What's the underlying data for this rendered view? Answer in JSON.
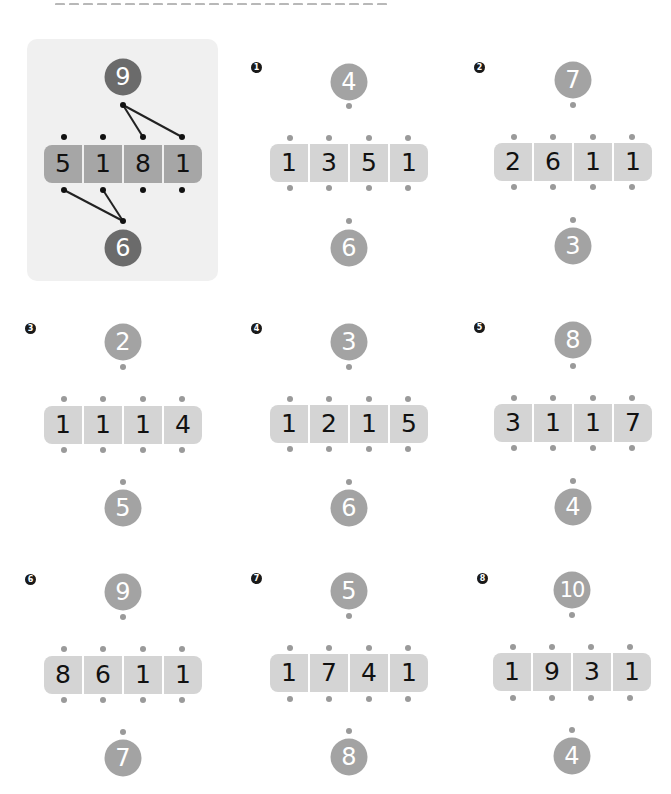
{
  "page": {
    "heading_clipped": true
  },
  "colors": {
    "example_panel_bg": "#f0f0f0",
    "example_circle": "#6b6b6b",
    "example_strip": "#a6a6a6",
    "circle": "#a3a3a3",
    "strip": "#d4d4d4",
    "dot": "#9a9a9a",
    "line": "#222222"
  },
  "example": {
    "top": "9",
    "digits": [
      "5",
      "1",
      "8",
      "1"
    ],
    "bottom": "6",
    "top_connects_to_cells": [
      2,
      3
    ],
    "bottom_connects_to_cells": [
      0,
      1
    ]
  },
  "problems": [
    {
      "number": "1",
      "badge": "❶",
      "top": "4",
      "digits": [
        "1",
        "3",
        "5",
        "1"
      ],
      "bottom": "6"
    },
    {
      "number": "2",
      "badge": "❷",
      "top": "7",
      "digits": [
        "2",
        "6",
        "1",
        "1"
      ],
      "bottom": "3"
    },
    {
      "number": "3",
      "badge": "❸",
      "top": "2",
      "digits": [
        "1",
        "1",
        "1",
        "4"
      ],
      "bottom": "5"
    },
    {
      "number": "4",
      "badge": "❹",
      "top": "3",
      "digits": [
        "1",
        "2",
        "1",
        "5"
      ],
      "bottom": "6"
    },
    {
      "number": "5",
      "badge": "❺",
      "top": "8",
      "digits": [
        "3",
        "1",
        "1",
        "7"
      ],
      "bottom": "4"
    },
    {
      "number": "6",
      "badge": "❻",
      "top": "9",
      "digits": [
        "8",
        "6",
        "1",
        "1"
      ],
      "bottom": "7"
    },
    {
      "number": "7",
      "badge": "❼",
      "top": "5",
      "digits": [
        "1",
        "7",
        "4",
        "1"
      ],
      "bottom": "8"
    },
    {
      "number": "8",
      "badge": "❽",
      "top": "10",
      "digits": [
        "1",
        "9",
        "3",
        "1"
      ],
      "bottom": "4"
    }
  ]
}
